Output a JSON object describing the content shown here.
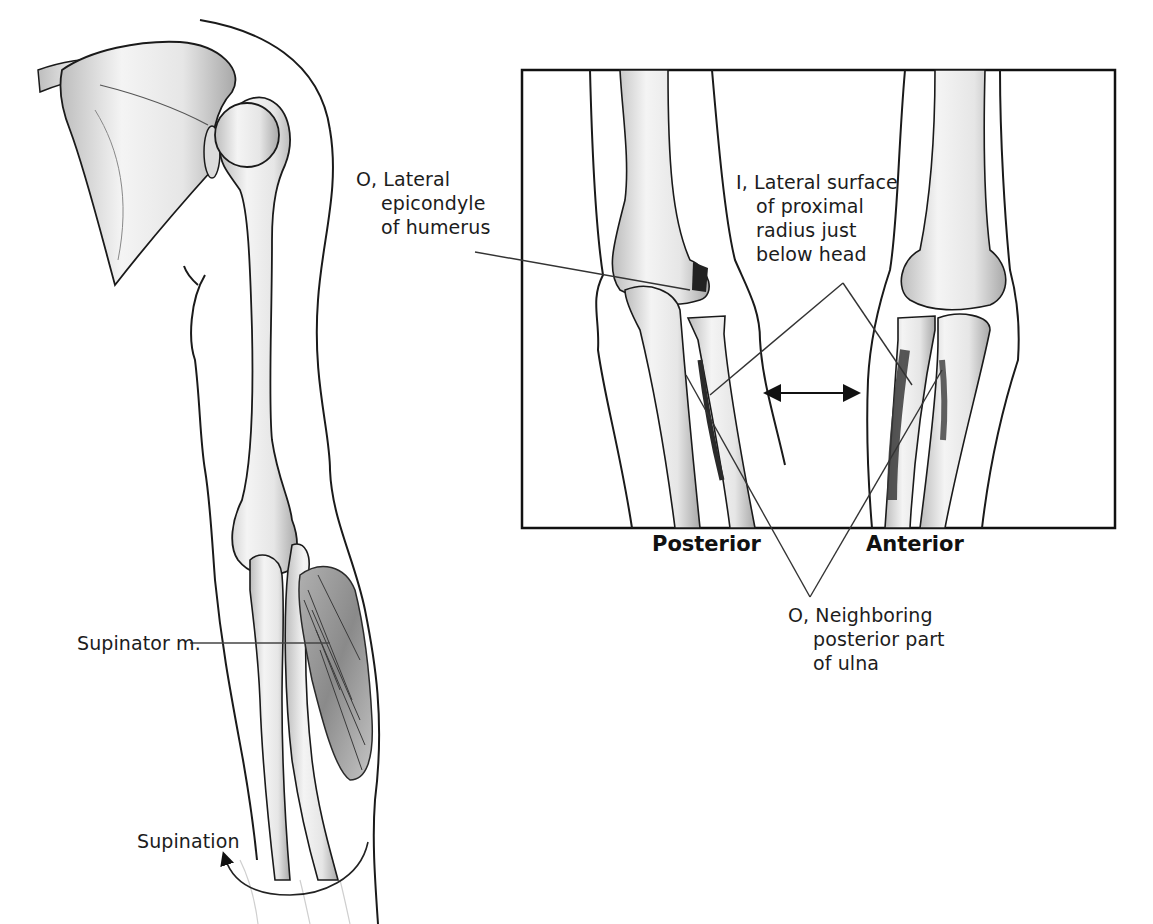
{
  "figure": {
    "left_panel": {
      "muscle_label": "Supinator m.",
      "motion_label": "Supination"
    },
    "inset_panel": {
      "origin_label": {
        "prefix": "O,",
        "lines": [
          "Lateral",
          "epicondyle",
          "of humerus"
        ]
      },
      "insertion_label": {
        "prefix": "I,",
        "lines": [
          "Lateral surface",
          "of proximal",
          "radius just",
          "below head"
        ]
      },
      "view_labels": {
        "posterior": "Posterior",
        "anterior": "Anterior"
      }
    },
    "secondary_origin_label": {
      "prefix": "O,",
      "lines": [
        "Neighboring",
        "posterior part",
        "of ulna"
      ]
    },
    "colors": {
      "line": "#1a1a1a",
      "bone_fill": "#f3f3f3",
      "bone_shade": "#b9b9b9",
      "muscle_fill": "#8c8c8c",
      "muscle_dark": "#3a3a3a"
    }
  }
}
